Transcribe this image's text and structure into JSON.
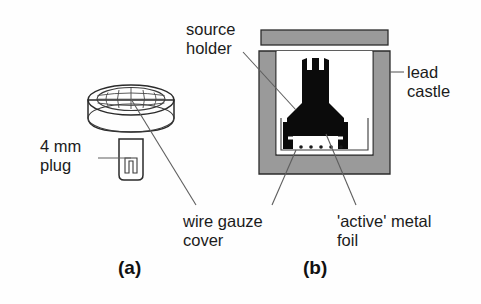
{
  "figure": {
    "background_color": "#fefefe",
    "lead_gray": "#9a9a9a",
    "lead_stroke": "#2b2b2b",
    "holder_black": "#0b0b0b",
    "leader_color": "#5e5e5e",
    "text_color": "#1b1b1b"
  },
  "panels": [
    {
      "id": "a",
      "label": "(a)"
    },
    {
      "id": "b",
      "label": "(b)"
    }
  ],
  "labels": {
    "plug": "4 mm\nplug",
    "plug_line1": "4 mm",
    "plug_line2": "plug",
    "wire_gauze_line1": "wire gauze",
    "wire_gauze_line2": "cover",
    "source_holder_line1": "source",
    "source_holder_line2": "holder",
    "lead_castle_line1": "lead",
    "lead_castle_line2": "castle",
    "active_foil_line1": "'active' metal",
    "active_foil_line2": "foil"
  },
  "parts": {
    "wire_gauze_cover": "wire-gauze-cover",
    "banana_plug": "4mm-plug",
    "source_holder": "source-holder",
    "lead_castle": "lead-castle",
    "active_metal_foil": "active-metal-foil"
  }
}
